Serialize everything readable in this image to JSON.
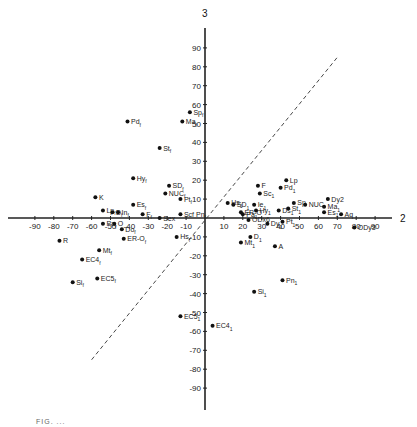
{
  "chart_data": {
    "type": "scatter",
    "title": "",
    "xlabel": "2",
    "ylabel": "3",
    "xlim": [
      -95,
      100
    ],
    "ylim": [
      -100,
      100
    ],
    "grid": false,
    "legend": null,
    "x_ticks": [
      -90,
      -80,
      -70,
      -60,
      -50,
      -40,
      -30,
      -20,
      -10,
      10,
      20,
      30,
      40,
      50,
      60,
      70,
      80,
      90
    ],
    "y_ticks": [
      90,
      80,
      70,
      60,
      50,
      40,
      30,
      20,
      10,
      -10,
      -20,
      -30,
      -40,
      -50,
      -60,
      -70,
      -80,
      -90
    ],
    "reference_line": {
      "style": "dashed",
      "from": [
        -60,
        -75
      ],
      "to": [
        70,
        85
      ]
    },
    "points": [
      {
        "label": "Pdf",
        "x": -41,
        "y": 51
      },
      {
        "label": "Spf",
        "x": -8,
        "y": 56
      },
      {
        "label": "Maf",
        "x": -12,
        "y": 51
      },
      {
        "label": "Stf",
        "x": -24,
        "y": 37
      },
      {
        "label": "Hyf",
        "x": -38,
        "y": 21
      },
      {
        "label": "SDf",
        "x": -19,
        "y": 17
      },
      {
        "label": "NUCf",
        "x": -21,
        "y": 13
      },
      {
        "label": "Ptf",
        "x": -13,
        "y": 10
      },
      {
        "label": "K",
        "x": -58,
        "y": 11
      },
      {
        "label": "Lpf",
        "x": -54,
        "y": 4
      },
      {
        "label": "Esf",
        "x": -38,
        "y": 7
      },
      {
        "label": "Inf",
        "x": -46,
        "y": 3
      },
      {
        "label": "Df",
        "x": -49,
        "y": 3
      },
      {
        "label": "Ff",
        "x": -33,
        "y": 2
      },
      {
        "label": "Sex",
        "x": -24,
        "y": 0
      },
      {
        "label": "Scf Pnf",
        "x": -13,
        "y": 2
      },
      {
        "label": "Paf",
        "x": -54,
        "y": -3
      },
      {
        "label": "O",
        "x": -48,
        "y": -3
      },
      {
        "label": "Dof",
        "x": -44,
        "y": -6
      },
      {
        "label": "ER-Of",
        "x": -43,
        "y": -11
      },
      {
        "label": "Hsf",
        "x": -15,
        "y": -10
      },
      {
        "label": "R",
        "x": -77,
        "y": -12
      },
      {
        "label": "Mtf",
        "x": -56,
        "y": -17
      },
      {
        "label": "EC4f",
        "x": -65,
        "y": -22
      },
      {
        "label": "EC5f",
        "x": -57,
        "y": -32
      },
      {
        "label": "Sif",
        "x": -70,
        "y": -34
      },
      {
        "label": "Lp",
        "x": 43,
        "y": 20
      },
      {
        "label": "Pd1",
        "x": 40,
        "y": 16
      },
      {
        "label": "F",
        "x": 28,
        "y": 17
      },
      {
        "label": "Sc1",
        "x": 29,
        "y": 13
      },
      {
        "label": "Hs1",
        "x": 12,
        "y": 8
      },
      {
        "label": "SD1",
        "x": 15,
        "y": 7
      },
      {
        "label": "Ie1",
        "x": 26,
        "y": 7
      },
      {
        "label": "Hy1",
        "x": 27,
        "y": 4
      },
      {
        "label": "ER-O",
        "x": 19,
        "y": 3
      },
      {
        "label": "Pa1",
        "x": 20,
        "y": 2
      },
      {
        "label": "ODx6",
        "x": 23,
        "y": -1
      },
      {
        "label": "Ds1",
        "x": 39,
        "y": 4
      },
      {
        "label": "St1",
        "x": 44,
        "y": 5
      },
      {
        "label": "Sp",
        "x": 47,
        "y": 8
      },
      {
        "label": "NUC",
        "x": 53,
        "y": 7
      },
      {
        "label": "Dy2",
        "x": 65,
        "y": 10
      },
      {
        "label": "Ma1",
        "x": 63,
        "y": 6
      },
      {
        "label": "Es1",
        "x": 63,
        "y": 3
      },
      {
        "label": "Aq",
        "x": 72,
        "y": 2
      },
      {
        "label": "ODy3",
        "x": 79,
        "y": -5
      },
      {
        "label": "Dy1",
        "x": 33,
        "y": -3
      },
      {
        "label": "Pt1",
        "x": 41,
        "y": -2
      },
      {
        "label": "D1",
        "x": 24,
        "y": -10
      },
      {
        "label": "Mt1",
        "x": 19,
        "y": -13
      },
      {
        "label": "A",
        "x": 37,
        "y": -15
      },
      {
        "label": "Pn1",
        "x": 41,
        "y": -33
      },
      {
        "label": "Si1",
        "x": 26,
        "y": -39
      },
      {
        "label": "EC51",
        "x": -13,
        "y": -52
      },
      {
        "label": "EC41",
        "x": 4,
        "y": -57
      }
    ]
  },
  "caption": "FIG. ..."
}
